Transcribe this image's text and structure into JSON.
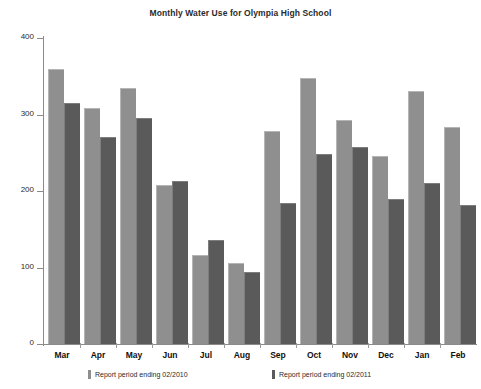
{
  "chart_data": {
    "type": "bar",
    "title": "Monthly Water Use for Olympia High School",
    "xlabel": "",
    "ylabel": "CCF",
    "ylim": [
      0,
      400
    ],
    "yticks": [
      0,
      100,
      200,
      300,
      400
    ],
    "grid": false,
    "legend_position": "bottom",
    "categories": [
      "Mar",
      "Apr",
      "May",
      "Jun",
      "Jul",
      "Aug",
      "Sep",
      "Oct",
      "Nov",
      "Dec",
      "Jan",
      "Feb"
    ],
    "series": [
      {
        "name": "Report period ending 02/2010",
        "color": "#8f8f8f",
        "values": [
          358,
          307,
          334,
          207,
          115,
          105,
          277,
          346,
          291,
          245,
          329,
          282
        ]
      },
      {
        "name": "Report period ending 02/2011",
        "color": "#5a5a5a",
        "values": [
          314,
          269,
          294,
          212,
          135,
          93,
          183,
          247,
          256,
          188,
          209,
          180
        ]
      }
    ]
  },
  "axes": {
    "y_title": "CCF",
    "y_tick_labels": [
      "400",
      "300",
      "200",
      "100",
      "0"
    ]
  },
  "legend": {
    "items": [
      {
        "label": "Report period ending 02/2010"
      },
      {
        "label": "Report period ending 02/2011"
      }
    ]
  },
  "colors": {
    "series_1": "#8f8f8f",
    "series_2": "#5a5a5a",
    "axis": "#8a8a8a",
    "background": "#ffffff"
  }
}
